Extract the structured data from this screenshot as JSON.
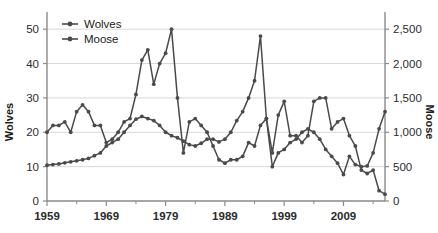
{
  "chart_data": {
    "type": "line",
    "title": "",
    "xlabel": "",
    "grid": "horizontal",
    "legend_position": "top-left-inside",
    "x": [
      1959,
      1960,
      1961,
      1962,
      1963,
      1964,
      1965,
      1966,
      1967,
      1968,
      1969,
      1970,
      1971,
      1972,
      1973,
      1974,
      1975,
      1976,
      1977,
      1978,
      1979,
      1980,
      1981,
      1982,
      1983,
      1984,
      1985,
      1986,
      1987,
      1988,
      1989,
      1990,
      1991,
      1992,
      1993,
      1994,
      1995,
      1996,
      1997,
      1998,
      1999,
      2000,
      2001,
      2002,
      2003,
      2004,
      2005,
      2006,
      2007,
      2008,
      2009,
      2010,
      2011,
      2012,
      2013,
      2014,
      2015,
      2016
    ],
    "xlim": [
      1959,
      2016
    ],
    "xticks": [
      1959,
      1969,
      1979,
      1989,
      1999,
      2009
    ],
    "xticklabels": [
      "1959",
      "1969",
      "1979",
      "1989",
      "1999",
      "2009"
    ],
    "xminorticks": [
      1964,
      1974,
      1984,
      1994,
      2004,
      2014
    ],
    "series": [
      {
        "name": "Wolves",
        "axis": "left",
        "color": "#4a4a4a",
        "ylabel": "Wolves",
        "ylim": [
          0,
          55
        ],
        "yticks": [
          0,
          10,
          20,
          30,
          40,
          50
        ],
        "yticklabels": [
          "0",
          "10",
          "20",
          "30",
          "40",
          "50"
        ],
        "values": [
          20,
          22,
          22,
          23,
          20,
          26,
          28,
          26,
          22,
          22,
          17,
          18,
          20,
          23,
          24,
          31,
          41,
          44,
          34,
          40,
          43,
          50,
          30,
          14,
          23,
          24,
          22,
          20,
          16,
          12,
          11,
          12,
          12,
          13,
          17,
          16,
          22,
          24,
          14,
          25,
          29,
          19,
          19,
          17,
          19,
          29,
          30,
          30,
          21,
          23,
          24,
          19,
          16,
          9,
          8,
          9,
          3,
          2
        ]
      },
      {
        "name": "Moose",
        "axis": "right",
        "color": "#4a4a4a",
        "ylabel": "Moose",
        "ylim": [
          0,
          2750
        ],
        "yticks": [
          0,
          500,
          1000,
          1500,
          2000,
          2500
        ],
        "yticklabels": [
          "0",
          "500",
          "1,000",
          "1,500",
          "2,000",
          "2,500"
        ],
        "values": [
          520,
          530,
          540,
          555,
          570,
          585,
          600,
          620,
          660,
          700,
          800,
          850,
          900,
          1000,
          1100,
          1190,
          1230,
          1200,
          1170,
          1100,
          1000,
          950,
          920,
          870,
          820,
          800,
          840,
          900,
          900,
          860,
          900,
          1000,
          1170,
          1300,
          1500,
          1750,
          2400,
          1200,
          500,
          700,
          750,
          850,
          900,
          1000,
          1050,
          1000,
          900,
          750,
          650,
          550,
          385,
          650,
          530,
          500,
          510,
          700,
          1050,
          1300
        ]
      }
    ]
  },
  "legend": {
    "items": [
      {
        "label": "Wolves"
      },
      {
        "label": "Moose"
      }
    ]
  },
  "axes": {
    "left_title": "Wolves",
    "right_title": "Moose"
  },
  "colors": {
    "line": "#4a4a4a",
    "grid": "#d8d8d8",
    "axis": "#8a8a8a",
    "text": "#1a1a1a",
    "background": "#ffffff"
  }
}
